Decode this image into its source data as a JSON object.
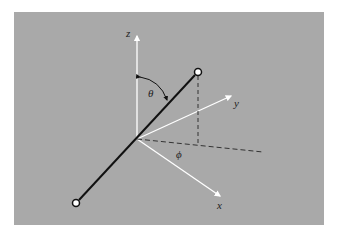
{
  "diagram": {
    "colors": {
      "background": "#a9a9a9",
      "axis": "#ffffff",
      "rod": "#111111",
      "dashed": "#333333"
    },
    "labels": {
      "z": "z",
      "y": "y",
      "x": "x",
      "theta": "θ",
      "phi": "ϕ"
    }
  }
}
